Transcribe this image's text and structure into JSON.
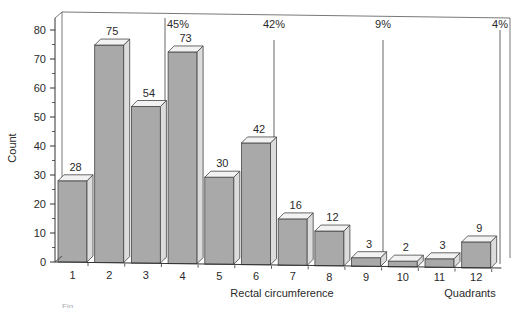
{
  "chart_data": {
    "type": "bar",
    "style": "3d-bars",
    "title": "",
    "xlabel": "Rectal circumference",
    "xlabel_secondary": "Quadrants",
    "ylabel": "Count",
    "ylim": [
      0,
      80
    ],
    "yticks": [
      0,
      10,
      20,
      30,
      40,
      50,
      60,
      70,
      80
    ],
    "grid": false,
    "categories": [
      "1",
      "2",
      "3",
      "4",
      "5",
      "6",
      "7",
      "8",
      "9",
      "10",
      "11",
      "12"
    ],
    "values": [
      28,
      75,
      54,
      73,
      30,
      42,
      16,
      12,
      3,
      2,
      3,
      9
    ],
    "bar_labels": [
      "28",
      "75",
      "54",
      "73",
      "30",
      "42",
      "16",
      "12",
      "3",
      "2",
      "3",
      "9"
    ],
    "group_annotations": [
      {
        "label": "45%",
        "after_category": "3"
      },
      {
        "label": "42%",
        "after_category": "6"
      },
      {
        "label": "9%",
        "after_category": "9"
      },
      {
        "label": "4%",
        "after_category": "12"
      }
    ],
    "colors": {
      "bar_front": "#a9a9a9",
      "bar_side": "#dcdcdc",
      "bar_top": "#f2f2f2",
      "axis": "#333333"
    }
  },
  "caption": {
    "text": "Fig. ..."
  }
}
